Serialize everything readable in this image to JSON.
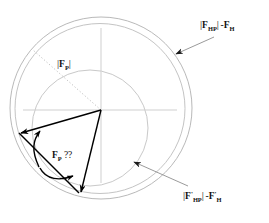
{
  "figure": {
    "title_visible": false,
    "background_color": "#ffffff",
    "stroke_colors": {
      "outer_circle": "#b9b9b9",
      "outer_circle_2": "#c4c4c4",
      "inner_circle": "#c9c9c9",
      "axes": "#cfcfcf",
      "dotted_radius": "#c0c0c0",
      "vector": "#000000",
      "leader": "#8e8e8e"
    },
    "origin": {
      "x": 101,
      "y": 110
    },
    "circles": [
      {
        "name": "outer-circle-1",
        "cx": 101,
        "cy": 108,
        "r": 91
      },
      {
        "name": "outer-circle-2",
        "cx": 100,
        "cy": 108,
        "r": 85
      },
      {
        "name": "inner-circle",
        "cx": 90,
        "cy": 128,
        "r": 58
      }
    ],
    "axes": {
      "vertical": {
        "x": 101,
        "y1": 28,
        "y2": 183
      },
      "horizontal": {
        "y": 110,
        "x1": 23,
        "x2": 177
      }
    },
    "dotted_radius": {
      "x1": 101,
      "y1": 110,
      "x2": 33,
      "y2": 50
    },
    "vectors": [
      {
        "name": "vector-fp-left",
        "x1": 101,
        "y1": 110,
        "x2": 18,
        "y2": 134
      },
      {
        "name": "vector-fp-down",
        "x1": 101,
        "y1": 110,
        "x2": 82,
        "y2": 196
      },
      {
        "name": "vector-chord",
        "x1": 18,
        "y1": 134,
        "x2": 82,
        "y2": 196
      }
    ],
    "arc_arrow": {
      "name": "double-headed-arc",
      "from": {
        "x": 37,
        "y": 170
      },
      "to": {
        "x": 77,
        "y": 176
      },
      "label": "F_P ??"
    },
    "leaders": [
      {
        "name": "leader-top-right",
        "from": {
          "x": 215,
          "y": 36
        },
        "to": {
          "x": 173,
          "y": 55
        }
      },
      {
        "name": "leader-bottom-right",
        "from": {
          "x": 186,
          "y": 186
        },
        "to": {
          "x": 131,
          "y": 160
        }
      }
    ]
  },
  "labels": {
    "fp_magnitude": {
      "bar_open": "|",
      "symbol": "F",
      "subscript": "P",
      "bar_close": "|",
      "full_text": "|F_P|"
    },
    "fp_question": {
      "symbol": "F",
      "subscript": "P",
      "question": "??",
      "full_text": "F_P ??"
    },
    "fhp_minus_fh": {
      "bar_open": "|",
      "symbol": "F",
      "subscript": "HP",
      "bar_close": "|",
      "minus": "-",
      "symbol2": "F",
      "subscript2": "H",
      "full_text": "|F_HP| -F_H"
    },
    "fhp_prime_minus_fh_prime": {
      "bar_open": "|",
      "symbol": "F",
      "prime": "'",
      "subscript": "HP",
      "bar_close": "|",
      "minus": "-",
      "symbol2": "F",
      "prime2": "'",
      "subscript2": "H",
      "full_text": "|F'_HP| -F'_H"
    }
  }
}
